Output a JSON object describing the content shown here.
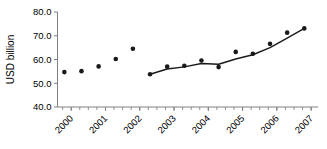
{
  "chart_data": {
    "type": "scatter",
    "title": "",
    "xlabel": "",
    "ylabel": "USD billion",
    "ylim": [
      40.0,
      80.0
    ],
    "yticks": [
      40.0,
      50.0,
      60.0,
      70.0,
      80.0
    ],
    "ytick_labels": [
      "40.0",
      "50.0",
      "60.0",
      "70.0",
      "80.0"
    ],
    "xlim": [
      1999.6,
      2007.2
    ],
    "xticks": [
      2000,
      2001,
      2002,
      2003,
      2004,
      2005,
      2006,
      2007
    ],
    "xtick_labels": [
      "2000",
      "2001",
      "2002",
      "2003",
      "2004",
      "2005",
      "2006",
      "2007"
    ],
    "xtick_rotation": -45,
    "grid": false,
    "legend": "none",
    "minor_ticks_per_year": 4,
    "series": [
      {
        "name": "quarterly-observations",
        "marker": "filled-circle",
        "color": "#1a1a1a",
        "points": [
          {
            "x": 1999.8,
            "y": 54.7
          },
          {
            "x": 2000.3,
            "y": 55.1
          },
          {
            "x": 2000.8,
            "y": 57.1
          },
          {
            "x": 2001.3,
            "y": 60.2
          },
          {
            "x": 2001.8,
            "y": 64.5
          },
          {
            "x": 2002.3,
            "y": 53.8
          },
          {
            "x": 2002.8,
            "y": 57.0
          },
          {
            "x": 2003.3,
            "y": 57.4
          },
          {
            "x": 2003.8,
            "y": 59.6
          },
          {
            "x": 2004.3,
            "y": 56.8
          },
          {
            "x": 2004.8,
            "y": 63.2
          },
          {
            "x": 2005.3,
            "y": 62.4
          },
          {
            "x": 2005.8,
            "y": 66.6
          },
          {
            "x": 2006.3,
            "y": 71.3
          },
          {
            "x": 2006.8,
            "y": 73.1
          }
        ]
      },
      {
        "name": "trend-line",
        "marker": "none",
        "color": "#1a1a1a",
        "points": [
          {
            "x": 2002.3,
            "y": 53.8
          },
          {
            "x": 2002.8,
            "y": 56.0
          },
          {
            "x": 2003.3,
            "y": 56.9
          },
          {
            "x": 2003.8,
            "y": 58.3
          },
          {
            "x": 2004.3,
            "y": 58.0
          },
          {
            "x": 2004.8,
            "y": 60.2
          },
          {
            "x": 2005.3,
            "y": 62.0
          },
          {
            "x": 2005.8,
            "y": 65.0
          },
          {
            "x": 2006.3,
            "y": 69.0
          },
          {
            "x": 2006.8,
            "y": 73.1
          }
        ]
      }
    ]
  }
}
